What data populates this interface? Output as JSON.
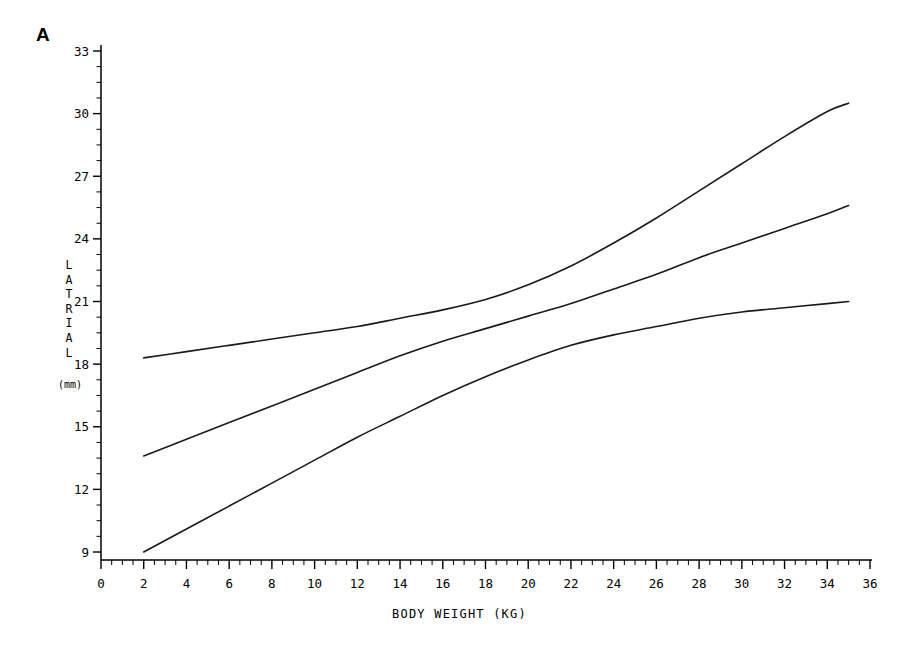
{
  "figure": {
    "panel_label": "A",
    "background_color": "#ffffff",
    "line_color": "#1a1a1a"
  },
  "chart_data": {
    "type": "line",
    "title": "",
    "panel": "A",
    "xlabel": "BODY WEIGHT (KG)",
    "ylabel": "LATRIAL",
    "ylabel_stacked": [
      "L",
      "A",
      "T",
      "R",
      "I",
      "A",
      "L"
    ],
    "yunit": "(mm)",
    "xlim": [
      0,
      36
    ],
    "ylim": [
      9,
      33
    ],
    "xticks": [
      0,
      2,
      4,
      6,
      8,
      10,
      12,
      14,
      16,
      18,
      20,
      22,
      24,
      26,
      28,
      30,
      32,
      34,
      36
    ],
    "xtick_labels": [
      "0",
      "2",
      "4",
      "6",
      "8",
      "10",
      "12",
      "14",
      "16",
      "18",
      "20",
      "22",
      "24",
      "26",
      "28",
      "30",
      "32",
      "34",
      "36"
    ],
    "yticks": [
      9,
      12,
      15,
      18,
      21,
      24,
      27,
      30,
      33
    ],
    "ytick_labels": [
      "9",
      "12",
      "15",
      "18",
      "21",
      "24",
      "27",
      "30",
      "33"
    ],
    "x_minor_tick_interval": 0.5,
    "y_minor_tick_interval": 0.75,
    "grid": false,
    "legend": null,
    "series": [
      {
        "name": "upper",
        "x": [
          2,
          4,
          6,
          8,
          10,
          12,
          14,
          16,
          18,
          20,
          22,
          24,
          26,
          28,
          30,
          32,
          34,
          35
        ],
        "values": [
          18.3,
          18.6,
          18.9,
          19.2,
          19.5,
          19.8,
          20.2,
          20.6,
          21.1,
          21.8,
          22.7,
          23.8,
          25.0,
          26.3,
          27.6,
          28.9,
          30.1,
          30.5
        ]
      },
      {
        "name": "middle",
        "x": [
          2,
          4,
          6,
          8,
          10,
          12,
          14,
          16,
          18,
          20,
          22,
          24,
          26,
          28,
          30,
          32,
          34,
          35
        ],
        "values": [
          13.6,
          14.4,
          15.2,
          16.0,
          16.8,
          17.6,
          18.4,
          19.1,
          19.7,
          20.3,
          20.9,
          21.6,
          22.3,
          23.1,
          23.8,
          24.5,
          25.2,
          25.6
        ]
      },
      {
        "name": "lower",
        "x": [
          2,
          4,
          6,
          8,
          10,
          12,
          14,
          16,
          18,
          20,
          22,
          24,
          26,
          28,
          30,
          32,
          34,
          35
        ],
        "values": [
          9.0,
          10.1,
          11.2,
          12.3,
          13.4,
          14.5,
          15.5,
          16.5,
          17.4,
          18.2,
          18.9,
          19.4,
          19.8,
          20.2,
          20.5,
          20.7,
          20.9,
          21.0
        ]
      }
    ]
  }
}
